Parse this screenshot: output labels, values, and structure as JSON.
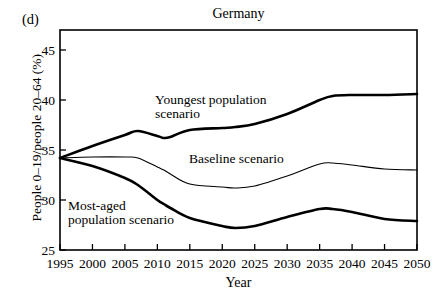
{
  "panel": {
    "label": "(d)"
  },
  "chart_data": {
    "type": "line",
    "title": "Germany",
    "xlabel": "Year",
    "ylabel": "People 0–19/people 20–64 (%)",
    "xlim": [
      1995,
      2050
    ],
    "ylim": [
      25,
      47
    ],
    "grid": false,
    "legend": "inline-annotations",
    "xticks": [
      1995,
      2000,
      2005,
      2010,
      2015,
      2020,
      2025,
      2030,
      2035,
      2040,
      2045,
      2050
    ],
    "xtick_labels": [
      "1995",
      "2000",
      "2005",
      "2010",
      "2015",
      "2020",
      "2025",
      "2030",
      "2035",
      "2040",
      "2045",
      "2050"
    ],
    "yticks": [
      25,
      30,
      35,
      40,
      45
    ],
    "ytick_labels": [
      "25",
      "30",
      "35",
      "40",
      "45"
    ],
    "x": [
      1995,
      2000,
      2005,
      2007,
      2010,
      2011,
      2012,
      2015,
      2020,
      2022,
      2025,
      2030,
      2035,
      2037,
      2040,
      2045,
      2050
    ],
    "series": [
      {
        "name": "Youngest population scenario",
        "annotation": "Youngest population scenario",
        "line_width": "thick",
        "color": "#000000",
        "values": [
          34.2,
          35.4,
          36.5,
          36.9,
          36.4,
          36.2,
          36.3,
          37.0,
          37.2,
          37.3,
          37.6,
          38.6,
          40.0,
          40.4,
          40.5,
          40.5,
          40.6
        ]
      },
      {
        "name": "Baseline scenario",
        "annotation": "Baseline scenario",
        "line_width": "thin",
        "color": "#000000",
        "values": [
          34.2,
          34.3,
          34.3,
          34.2,
          33.3,
          33.0,
          32.6,
          31.6,
          31.3,
          31.2,
          31.4,
          32.4,
          33.6,
          33.7,
          33.5,
          33.1,
          33.0
        ]
      },
      {
        "name": "Most-aged population scenario",
        "annotation": "Most-aged population scenario",
        "line_width": "thick",
        "color": "#000000",
        "values": [
          34.2,
          33.4,
          32.2,
          31.5,
          30.0,
          29.6,
          29.2,
          28.2,
          27.4,
          27.2,
          27.4,
          28.3,
          29.1,
          29.1,
          28.8,
          28.1,
          27.9
        ]
      }
    ],
    "annotations": [
      {
        "text_line1": "Youngest population",
        "text_line2": "scenario"
      },
      {
        "text_line1": "Baseline scenario",
        "text_line2": ""
      },
      {
        "text_line1": "Most-aged",
        "text_line2": "population scenario"
      }
    ]
  }
}
